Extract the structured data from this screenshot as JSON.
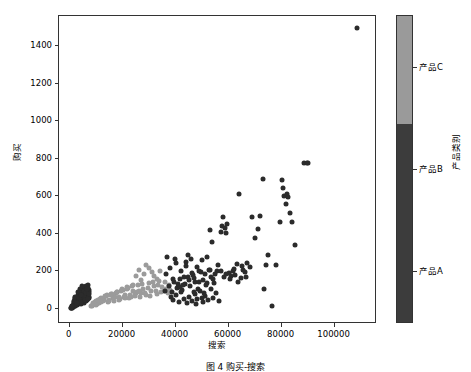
{
  "figure": {
    "caption": "图 4  购买-搜索"
  },
  "chart_data": {
    "type": "scatter",
    "title": "",
    "xlabel": "搜索",
    "ylabel": "购买",
    "xlim": [
      -4000,
      116000
    ],
    "ylim": [
      -80,
      1560
    ],
    "xticks": [
      0,
      20000,
      40000,
      60000,
      80000,
      100000
    ],
    "xticklabels": [
      "0",
      "20000",
      "40000",
      "60000",
      "80000",
      "100000"
    ],
    "yticks": [
      0,
      200,
      400,
      600,
      800,
      1000,
      1200,
      1400
    ],
    "yticklabels": [
      "0",
      "200",
      "400",
      "600",
      "800",
      "1000",
      "1200",
      "1400"
    ],
    "grid": false,
    "legend_position": "right-colorbar",
    "colorbar": {
      "label": "产品类别",
      "ticklabels": [
        "产品A",
        "产品B",
        "产品C"
      ],
      "tickvalues": [
        0.17,
        0.5,
        0.83
      ],
      "segments": [
        {
          "name": "产品C",
          "color": "#9a9a9a",
          "from": 0.65,
          "to": 1.0
        },
        {
          "name": "产品B",
          "color": "#3c3c3c",
          "from": 0.0,
          "to": 0.65
        }
      ]
    },
    "series": [
      {
        "name": "产品A",
        "color": "#2b2b2b",
        "points": [
          [
            900,
            5
          ],
          [
            1400,
            12
          ],
          [
            1800,
            30
          ],
          [
            2100,
            18
          ],
          [
            2500,
            45
          ],
          [
            2800,
            22
          ],
          [
            3100,
            60
          ],
          [
            3400,
            35
          ],
          [
            3600,
            75
          ],
          [
            3900,
            50
          ],
          [
            4200,
            92
          ],
          [
            4400,
            28
          ],
          [
            4700,
            70
          ],
          [
            4900,
            105
          ],
          [
            5200,
            58
          ],
          [
            5400,
            85
          ],
          [
            5700,
            40
          ],
          [
            5900,
            118
          ],
          [
            6100,
            66
          ],
          [
            6400,
            95
          ],
          [
            6600,
            48
          ],
          [
            6900,
            130
          ],
          [
            7100,
            72
          ],
          [
            7400,
            100
          ],
          [
            1100,
            8
          ],
          [
            1600,
            20
          ],
          [
            2300,
            38
          ],
          [
            2900,
            55
          ],
          [
            3300,
            25
          ],
          [
            3800,
            80
          ],
          [
            4100,
            62
          ],
          [
            4600,
            44
          ],
          [
            5000,
            88
          ],
          [
            5500,
            33
          ],
          [
            6000,
            110
          ],
          [
            6300,
            52
          ],
          [
            6800,
            78
          ],
          [
            7200,
            60
          ],
          [
            2000,
            15
          ],
          [
            2600,
            42
          ],
          [
            3000,
            28
          ],
          [
            3500,
            68
          ],
          [
            4000,
            36
          ],
          [
            4500,
            96
          ],
          [
            5100,
            74
          ],
          [
            5600,
            50
          ],
          [
            6200,
            124
          ],
          [
            6700,
            82
          ],
          [
            7000,
            56
          ],
          [
            1300,
            10
          ],
          [
            1900,
            24
          ],
          [
            2400,
            48
          ],
          [
            3200,
            32
          ],
          [
            3700,
            64
          ],
          [
            4300,
            86
          ],
          [
            4800,
            40
          ],
          [
            5300,
            102
          ],
          [
            5800,
            70
          ],
          [
            6500,
            58
          ],
          [
            7300,
            90
          ],
          [
            800,
            4
          ],
          [
            1200,
            14
          ],
          [
            1700,
            26
          ],
          [
            2200,
            52
          ],
          [
            2700,
            34
          ],
          [
            3050,
            72
          ],
          [
            3450,
            46
          ],
          [
            3950,
            108
          ],
          [
            4350,
            30
          ],
          [
            4750,
            84
          ],
          [
            5150,
            66
          ],
          [
            5550,
            98
          ],
          [
            6050,
            44
          ],
          [
            6450,
            76
          ],
          [
            6850,
            114
          ],
          [
            7150,
            62
          ],
          [
            600,
            6
          ],
          [
            1000,
            16
          ],
          [
            1500,
            36
          ],
          [
            2050,
            58
          ],
          [
            2550,
            20
          ],
          [
            3150,
            66
          ],
          [
            3550,
            92
          ],
          [
            4050,
            54
          ],
          [
            4450,
            38
          ],
          [
            4850,
            120
          ],
          [
            5250,
            68
          ],
          [
            5650,
            46
          ],
          [
            6150,
            86
          ],
          [
            6550,
            104
          ],
          [
            7050,
            54
          ],
          [
            7500,
            80
          ],
          [
            500,
            3
          ],
          [
            1050,
            18
          ],
          [
            1550,
            42
          ],
          [
            2150,
            64
          ],
          [
            2650,
            30
          ],
          [
            3250,
            88
          ],
          [
            3650,
            56
          ],
          [
            4150,
            74
          ]
        ]
      },
      {
        "name": "产品B",
        "color": "#9b9b9b",
        "points": [
          [
            8500,
            18
          ],
          [
            9500,
            36
          ],
          [
            10500,
            28
          ],
          [
            11500,
            52
          ],
          [
            12500,
            44
          ],
          [
            13500,
            68
          ],
          [
            14500,
            38
          ],
          [
            15500,
            74
          ],
          [
            16500,
            58
          ],
          [
            17500,
            86
          ],
          [
            18500,
            48
          ],
          [
            19500,
            96
          ],
          [
            20500,
            66
          ],
          [
            21500,
            108
          ],
          [
            22500,
            56
          ],
          [
            23500,
            120
          ],
          [
            24500,
            78
          ],
          [
            25500,
            92
          ],
          [
            26500,
            62
          ],
          [
            27500,
            134
          ],
          [
            28500,
            84
          ],
          [
            29500,
            110
          ],
          [
            30500,
            70
          ],
          [
            31500,
            146
          ],
          [
            32500,
            98
          ],
          [
            33500,
            126
          ],
          [
            34500,
            88
          ],
          [
            30000,
            216
          ],
          [
            31000,
            198
          ],
          [
            32000,
            178
          ],
          [
            29000,
            232
          ],
          [
            33000,
            160
          ],
          [
            34000,
            204
          ],
          [
            28000,
            186
          ],
          [
            27000,
            152
          ],
          [
            9000,
            24
          ],
          [
            10000,
            42
          ],
          [
            11000,
            34
          ],
          [
            12000,
            60
          ],
          [
            13000,
            50
          ],
          [
            14000,
            76
          ],
          [
            15000,
            44
          ],
          [
            16000,
            82
          ],
          [
            17000,
            64
          ],
          [
            18000,
            92
          ],
          [
            19000,
            54
          ],
          [
            20000,
            102
          ],
          [
            21000,
            72
          ],
          [
            22000,
            114
          ],
          [
            23000,
            62
          ],
          [
            24000,
            128
          ],
          [
            25000,
            84
          ],
          [
            26000,
            98
          ],
          [
            8000,
            14
          ],
          [
            8800,
            30
          ],
          [
            9800,
            22
          ],
          [
            10800,
            46
          ],
          [
            11800,
            38
          ],
          [
            12800,
            58
          ],
          [
            13800,
            70
          ],
          [
            14800,
            50
          ],
          [
            15800,
            78
          ],
          [
            16800,
            42
          ],
          [
            17800,
            88
          ],
          [
            18800,
            66
          ],
          [
            19800,
            104
          ],
          [
            20800,
            60
          ],
          [
            21800,
            118
          ],
          [
            22800,
            74
          ],
          [
            23800,
            96
          ],
          [
            24800,
            68
          ],
          [
            25800,
            130
          ],
          [
            26800,
            86
          ],
          [
            27800,
            106
          ],
          [
            28800,
            76
          ],
          [
            29800,
            140
          ],
          [
            30800,
            94
          ],
          [
            31800,
            122
          ],
          [
            32800,
            80
          ],
          [
            33800,
            150
          ],
          [
            35000,
            118
          ],
          [
            35500,
            96
          ],
          [
            36000,
            142
          ],
          [
            36500,
            108
          ],
          [
            37000,
            86
          ],
          [
            37500,
            130
          ],
          [
            38000,
            102
          ],
          [
            26000,
            208
          ],
          [
            25000,
            176
          ]
        ]
      },
      {
        "name": "产品C",
        "color": "#2b2b2b",
        "points": [
          [
            36000,
            96
          ],
          [
            37500,
            124
          ],
          [
            38500,
            88
          ],
          [
            39500,
            146
          ],
          [
            40500,
            110
          ],
          [
            41500,
            158
          ],
          [
            42500,
            102
          ],
          [
            43500,
            134
          ],
          [
            44500,
            168
          ],
          [
            45500,
            120
          ],
          [
            46500,
            182
          ],
          [
            47500,
            142
          ],
          [
            48500,
            108
          ],
          [
            49500,
            196
          ],
          [
            50500,
            156
          ],
          [
            51500,
            128
          ],
          [
            52500,
            210
          ],
          [
            53500,
            172
          ],
          [
            54500,
            140
          ],
          [
            55500,
            204
          ],
          [
            36500,
            188
          ],
          [
            38000,
            216
          ],
          [
            39000,
            160
          ],
          [
            40000,
            246
          ],
          [
            41000,
            134
          ],
          [
            42000,
            200
          ],
          [
            43000,
            172
          ],
          [
            44000,
            230
          ],
          [
            45000,
            152
          ],
          [
            46000,
            194
          ],
          [
            47000,
            166
          ],
          [
            48000,
            222
          ],
          [
            49000,
            146
          ],
          [
            50000,
            260
          ],
          [
            51000,
            184
          ],
          [
            52000,
            138
          ],
          [
            53000,
            206
          ],
          [
            54000,
            160
          ],
          [
            55000,
            188
          ],
          [
            56000,
            232
          ],
          [
            38200,
            62
          ],
          [
            39200,
            46
          ],
          [
            40200,
            74
          ],
          [
            41200,
            38
          ],
          [
            42200,
            88
          ],
          [
            43200,
            54
          ],
          [
            44200,
            30
          ],
          [
            45200,
            66
          ],
          [
            46200,
            44
          ],
          [
            47200,
            78
          ],
          [
            48200,
            52
          ],
          [
            49200,
            96
          ],
          [
            50200,
            36
          ],
          [
            51200,
            70
          ],
          [
            52200,
            48
          ],
          [
            53200,
            104
          ],
          [
            54200,
            58
          ],
          [
            55200,
            84
          ],
          [
            56200,
            40
          ],
          [
            36800,
            276
          ],
          [
            44800,
            288
          ],
          [
            45800,
            268
          ],
          [
            51800,
            278
          ],
          [
            52800,
            420
          ],
          [
            53800,
            358
          ],
          [
            57000,
            412
          ],
          [
            57500,
            440
          ],
          [
            58500,
            432
          ],
          [
            58000,
            490
          ],
          [
            59000,
            402
          ],
          [
            59500,
            452
          ],
          [
            60000,
            194
          ],
          [
            61000,
            176
          ],
          [
            62000,
            212
          ],
          [
            63000,
            238
          ],
          [
            64000,
            614
          ],
          [
            65000,
            228
          ],
          [
            66000,
            196
          ],
          [
            67000,
            244
          ],
          [
            68000,
            222
          ],
          [
            69000,
            492
          ],
          [
            70000,
            380
          ],
          [
            71000,
            426
          ],
          [
            72000,
            494
          ],
          [
            73000,
            692
          ],
          [
            73500,
            108
          ],
          [
            74000,
            236
          ],
          [
            75000,
            288
          ],
          [
            76500,
            18
          ],
          [
            78000,
            234
          ],
          [
            79500,
            462
          ],
          [
            80000,
            688
          ],
          [
            80500,
            646
          ],
          [
            81000,
            604
          ],
          [
            81500,
            560
          ],
          [
            82000,
            610
          ],
          [
            82500,
            596
          ],
          [
            83000,
            512
          ],
          [
            84000,
            462
          ],
          [
            85000,
            340
          ],
          [
            88500,
            776
          ],
          [
            89500,
            778
          ],
          [
            90000,
            778
          ],
          [
            108500,
            1496
          ],
          [
            57200,
            204
          ],
          [
            58200,
            168
          ],
          [
            59200,
            186
          ],
          [
            60500,
            158
          ],
          [
            61500,
            204
          ],
          [
            62500,
            182
          ],
          [
            63500,
            146
          ],
          [
            64500,
            164
          ],
          [
            65500,
            210
          ],
          [
            66500,
            172
          ],
          [
            39800,
            266
          ],
          [
            43800,
            252
          ],
          [
            48800,
            202
          ],
          [
            49800,
            58
          ],
          [
            46800,
            92
          ],
          [
            47800,
            24
          ],
          [
            50800,
            86
          ],
          [
            41800,
            116
          ],
          [
            42800,
            126
          ]
        ]
      }
    ]
  }
}
